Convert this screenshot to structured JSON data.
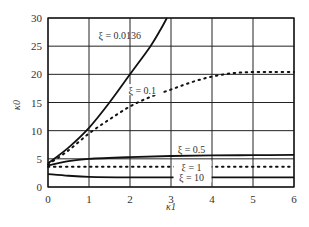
{
  "chart_data": {
    "type": "line",
    "title": "",
    "xlabel": "κ1",
    "ylabel": "κ0",
    "xlim": [
      0,
      6
    ],
    "ylim": [
      0,
      30
    ],
    "xticks": [
      0,
      1,
      2,
      3,
      4,
      5,
      6
    ],
    "yticks": [
      0,
      5,
      10,
      15,
      20,
      25,
      30
    ],
    "grid": true,
    "legend": "inline annotations",
    "series": [
      {
        "name": "ξ = 0.0136",
        "style": "solid",
        "x": [
          0,
          0.5,
          1,
          1.5,
          2,
          2.5,
          2.75,
          2.9
        ],
        "y": [
          4.2,
          7,
          10.5,
          15,
          20,
          25,
          28,
          30
        ],
        "label_pos": [
          1.75,
          27
        ]
      },
      {
        "name": "ξ = 0.1",
        "style": "dotted",
        "x": [
          0,
          0.5,
          1,
          1.5,
          2,
          2.5,
          3,
          3.5,
          4,
          4.5,
          5,
          5.5,
          6
        ],
        "y": [
          4,
          6.5,
          9.5,
          12,
          14.3,
          16,
          17.3,
          18.6,
          19.6,
          20.2,
          20.4,
          20.4,
          20.4
        ],
        "label_pos": [
          2.3,
          17.2
        ]
      },
      {
        "name": "ξ = 0.5",
        "style": "solid",
        "x": [
          0,
          0.5,
          1,
          2,
          3,
          4,
          5,
          6
        ],
        "y": [
          3.8,
          4.6,
          5,
          5.3,
          5.5,
          5.6,
          5.65,
          5.7
        ],
        "label_pos": [
          3.5,
          6.7
        ]
      },
      {
        "name": "ξ = 1",
        "style": "dotted",
        "x": [
          0,
          1,
          2,
          3,
          4,
          5,
          6
        ],
        "y": [
          3.6,
          3.6,
          3.6,
          3.6,
          3.6,
          3.6,
          3.6
        ],
        "label_pos": [
          3.5,
          3.6
        ]
      },
      {
        "name": "ξ = 10",
        "style": "solid",
        "x": [
          0,
          0.5,
          1,
          2,
          3,
          4,
          5,
          6
        ],
        "y": [
          2.3,
          2.0,
          1.8,
          1.7,
          1.7,
          1.7,
          1.7,
          1.7
        ],
        "label_pos": [
          3.5,
          1.7
        ]
      }
    ]
  }
}
